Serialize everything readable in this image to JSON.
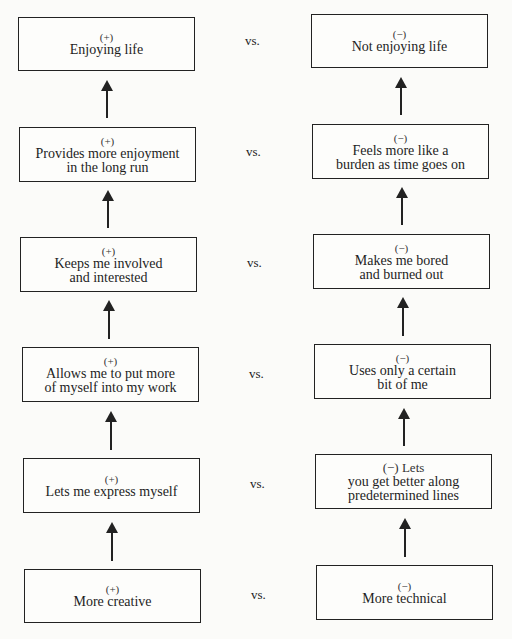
{
  "diagram": {
    "separator": "vs.",
    "left_column": [
      {
        "sign": "(+)",
        "lines": [
          "Enjoying life"
        ]
      },
      {
        "sign": "(+)",
        "lines": [
          "Provides more enjoyment",
          "in the long run"
        ]
      },
      {
        "sign": "(+)",
        "lines": [
          "Keeps me involved",
          "and interested"
        ]
      },
      {
        "sign": "(+)",
        "lines": [
          "Allows me to put more",
          "of myself into my work"
        ]
      },
      {
        "sign": "(+)",
        "lines": [
          "Lets me express myself"
        ]
      },
      {
        "sign": "(+)",
        "lines": [
          "More creative"
        ]
      }
    ],
    "right_column": [
      {
        "sign": "(−)",
        "lines": [
          "Not enjoying life"
        ]
      },
      {
        "sign": "(−)",
        "lines": [
          "Feels more like a",
          "burden as time goes on"
        ]
      },
      {
        "sign": "(−)",
        "lines": [
          "Makes me bored",
          "and burned out"
        ]
      },
      {
        "sign": "(−)",
        "lines": [
          "Uses only a certain",
          "bit of me"
        ]
      },
      {
        "sign": "(−) Lets",
        "lines": [
          "you get better along",
          "predetermined lines"
        ]
      },
      {
        "sign": "(−)",
        "lines": [
          "More technical"
        ]
      }
    ],
    "arrow_direction": "up"
  }
}
